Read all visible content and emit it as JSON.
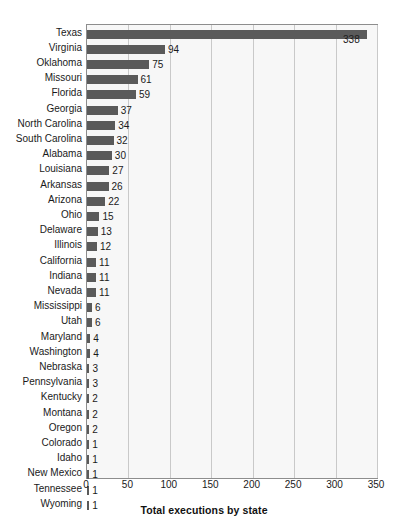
{
  "chart_data": {
    "type": "bar",
    "orientation": "horizontal",
    "title": "",
    "xlabel": "Total executions by state",
    "ylabel": "",
    "xlim": [
      0,
      350
    ],
    "xticks": [
      0,
      50,
      100,
      150,
      200,
      250,
      300,
      350
    ],
    "grid": true,
    "legend": false,
    "bar_color": "#5a5a5a",
    "plot_background": "#f7f7f7",
    "gridline_color": "#c9c9c9",
    "border_color": "#8d8d8d",
    "categories": [
      "Texas",
      "Virginia",
      "Oklahoma",
      "Missouri",
      "Florida",
      "Georgia",
      "North Carolina",
      "South Carolina",
      "Alabama",
      "Louisiana",
      "Arkansas",
      "Arizona",
      "Ohio",
      "Delaware",
      "Illinois",
      "California",
      "Indiana",
      "Nevada",
      "Mississippi",
      "Utah",
      "Maryland",
      "Washington",
      "Nebraska",
      "Pennsylvania",
      "Kentucky",
      "Montana",
      "Oregon",
      "Colorado",
      "Idaho",
      "New Mexico",
      "Tennessee",
      "Wyoming"
    ],
    "values": [
      338,
      94,
      75,
      61,
      59,
      37,
      34,
      32,
      30,
      27,
      26,
      22,
      15,
      13,
      12,
      11,
      11,
      11,
      6,
      6,
      4,
      4,
      3,
      3,
      2,
      2,
      2,
      1,
      1,
      1,
      1,
      1
    ]
  }
}
